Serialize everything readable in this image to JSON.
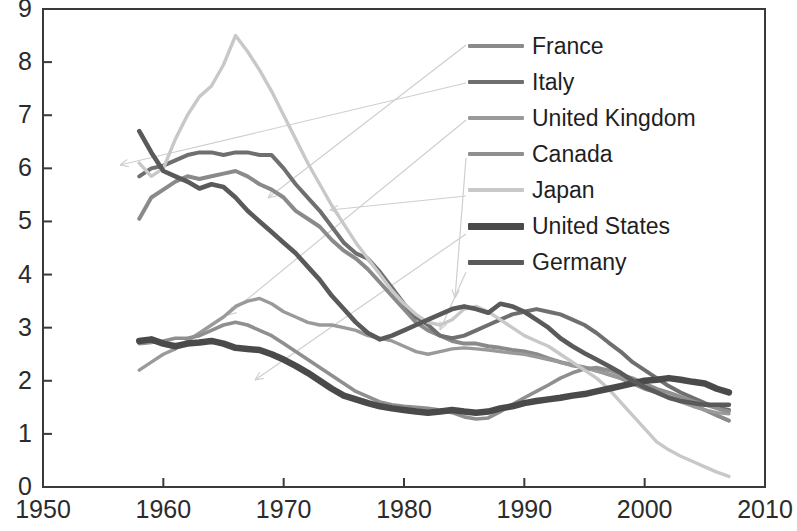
{
  "chart_data": {
    "type": "line",
    "title": "",
    "subtitle": "",
    "xlabel": "",
    "ylabel": "",
    "xlim": [
      1950,
      2010
    ],
    "ylim": [
      0,
      9
    ],
    "xticks": [
      1950,
      1960,
      1970,
      1980,
      1990,
      2000,
      2010
    ],
    "yticks": [
      0,
      1,
      2,
      3,
      4,
      5,
      6,
      7,
      8,
      9
    ],
    "grid": false,
    "legend_position": "top-right",
    "legend": [
      "France",
      "Italy",
      "United Kingdom",
      "Canada",
      "Japan",
      "United States",
      "Germany"
    ],
    "series": [
      {
        "name": "France",
        "color": "#8a8a8a",
        "width": 4.0,
        "x": [
          1958,
          1959,
          1960,
          1961,
          1962,
          1963,
          1964,
          1965,
          1966,
          1967,
          1968,
          1969,
          1970,
          1971,
          1972,
          1973,
          1974,
          1975,
          1976,
          1977,
          1978,
          1979,
          1980,
          1981,
          1982,
          1983,
          1984,
          1985,
          1986,
          1987,
          1988,
          1989,
          1990,
          1991,
          1992,
          1993,
          1994,
          1995,
          1996,
          1997,
          1998,
          1999,
          2000,
          2001,
          2002,
          2003,
          2004,
          2005,
          2006,
          2007
        ],
        "values": [
          5.05,
          5.45,
          5.6,
          5.75,
          5.85,
          5.8,
          5.85,
          5.9,
          5.95,
          5.85,
          5.7,
          5.6,
          5.45,
          5.2,
          5.05,
          4.9,
          4.65,
          4.45,
          4.3,
          4.1,
          3.85,
          3.6,
          3.35,
          3.1,
          2.95,
          2.85,
          2.75,
          2.7,
          2.7,
          2.65,
          2.62,
          2.58,
          2.55,
          2.5,
          2.42,
          2.35,
          2.3,
          2.25,
          2.2,
          2.12,
          2.05,
          1.95,
          1.85,
          1.78,
          1.7,
          1.62,
          1.55,
          1.45,
          1.35,
          1.25
        ]
      },
      {
        "name": "Italy",
        "color": "#6f6f6f",
        "width": 4.0,
        "x": [
          1958,
          1959,
          1960,
          1961,
          1962,
          1963,
          1964,
          1965,
          1966,
          1967,
          1968,
          1969,
          1970,
          1971,
          1972,
          1973,
          1974,
          1975,
          1976,
          1977,
          1978,
          1979,
          1980,
          1981,
          1982,
          1983,
          1984,
          1985,
          1986,
          1987,
          1988,
          1989,
          1990,
          1991,
          1992,
          1993,
          1994,
          1995,
          1996,
          1997,
          1998,
          1999,
          2000,
          2001,
          2002,
          2003,
          2004,
          2005,
          2006,
          2007
        ],
        "values": [
          5.85,
          6.0,
          6.05,
          6.15,
          6.25,
          6.3,
          6.3,
          6.25,
          6.3,
          6.3,
          6.25,
          6.25,
          6.0,
          5.7,
          5.45,
          5.2,
          4.9,
          4.6,
          4.4,
          4.3,
          4.05,
          3.75,
          3.45,
          3.2,
          3.05,
          2.85,
          2.8,
          2.85,
          2.95,
          3.05,
          3.15,
          3.25,
          3.3,
          3.35,
          3.3,
          3.25,
          3.15,
          3.05,
          2.9,
          2.72,
          2.55,
          2.35,
          2.2,
          2.05,
          1.9,
          1.78,
          1.68,
          1.58,
          1.5,
          1.45
        ]
      },
      {
        "name": "United Kingdom",
        "color": "#9a9a9a",
        "width": 3.4,
        "x": [
          1958,
          1959,
          1960,
          1961,
          1962,
          1963,
          1964,
          1965,
          1966,
          1967,
          1968,
          1969,
          1970,
          1971,
          1972,
          1973,
          1974,
          1975,
          1976,
          1977,
          1978,
          1979,
          1980,
          1981,
          1982,
          1983,
          1984,
          1985,
          1986,
          1987,
          1988,
          1989,
          1990,
          1991,
          1992,
          1993,
          1994,
          1995,
          1996,
          1997,
          1998,
          1999,
          2000,
          2001,
          2002,
          2003,
          2004,
          2005,
          2006,
          2007
        ],
        "values": [
          2.2,
          2.35,
          2.5,
          2.6,
          2.75,
          2.9,
          3.05,
          3.2,
          3.4,
          3.5,
          3.55,
          3.45,
          3.3,
          3.2,
          3.1,
          3.05,
          3.05,
          3.0,
          2.95,
          2.85,
          2.8,
          2.75,
          2.65,
          2.55,
          2.5,
          2.55,
          2.6,
          2.62,
          2.6,
          2.58,
          2.55,
          2.52,
          2.5,
          2.45,
          2.4,
          2.35,
          2.28,
          2.25,
          2.18,
          2.12,
          2.05,
          1.98,
          1.88,
          1.8,
          1.7,
          1.6,
          1.52,
          1.45,
          1.4,
          1.38
        ]
      },
      {
        "name": "Canada",
        "color": "#8f8f8f",
        "width": 3.6,
        "x": [
          1958,
          1959,
          1960,
          1961,
          1962,
          1963,
          1964,
          1965,
          1966,
          1967,
          1968,
          1969,
          1970,
          1971,
          1972,
          1973,
          1974,
          1975,
          1976,
          1977,
          1978,
          1979,
          1980,
          1981,
          1982,
          1983,
          1984,
          1985,
          1986,
          1987,
          1988,
          1989,
          1990,
          1991,
          1992,
          1993,
          1994,
          1995,
          1996,
          1997,
          1998,
          1999,
          2000,
          2001,
          2002,
          2003,
          2004,
          2005,
          2006,
          2007
        ],
        "values": [
          2.7,
          2.72,
          2.75,
          2.8,
          2.8,
          2.85,
          2.95,
          3.05,
          3.1,
          3.05,
          2.95,
          2.85,
          2.7,
          2.55,
          2.4,
          2.25,
          2.1,
          1.95,
          1.8,
          1.7,
          1.6,
          1.55,
          1.52,
          1.5,
          1.48,
          1.45,
          1.4,
          1.32,
          1.28,
          1.3,
          1.42,
          1.55,
          1.68,
          1.8,
          1.92,
          2.05,
          2.15,
          2.22,
          2.25,
          2.2,
          2.12,
          2.05,
          1.95,
          1.85,
          1.78,
          1.7,
          1.62,
          1.55,
          1.48,
          1.42
        ]
      },
      {
        "name": "Japan",
        "color": "#c8c8c8",
        "width": 3.4,
        "x": [
          1958,
          1959,
          1960,
          1961,
          1962,
          1963,
          1964,
          1965,
          1966,
          1967,
          1968,
          1969,
          1970,
          1971,
          1972,
          1973,
          1974,
          1975,
          1976,
          1977,
          1978,
          1979,
          1980,
          1981,
          1982,
          1983,
          1984,
          1985,
          1986,
          1987,
          1988,
          1989,
          1990,
          1991,
          1992,
          1993,
          1994,
          1995,
          1996,
          1997,
          1998,
          1999,
          2000,
          2001,
          2002,
          2003,
          2004,
          2005,
          2006,
          2007
        ],
        "values": [
          6.1,
          5.85,
          6.0,
          6.55,
          7.0,
          7.35,
          7.55,
          7.95,
          8.5,
          8.2,
          7.85,
          7.45,
          7.0,
          6.55,
          6.1,
          5.7,
          5.3,
          4.95,
          4.6,
          4.3,
          4.0,
          3.7,
          3.45,
          3.25,
          3.1,
          3.05,
          3.15,
          3.35,
          3.4,
          3.3,
          3.15,
          3.0,
          2.85,
          2.75,
          2.65,
          2.5,
          2.35,
          2.2,
          2.05,
          1.85,
          1.6,
          1.35,
          1.1,
          0.85,
          0.7,
          0.58,
          0.48,
          0.38,
          0.28,
          0.2
        ]
      },
      {
        "name": "United States",
        "color": "#4a4a4a",
        "width": 6.5,
        "x": [
          1958,
          1959,
          1960,
          1961,
          1962,
          1963,
          1964,
          1965,
          1966,
          1967,
          1968,
          1969,
          1970,
          1971,
          1972,
          1973,
          1974,
          1975,
          1976,
          1977,
          1978,
          1979,
          1980,
          1981,
          1982,
          1983,
          1984,
          1985,
          1986,
          1987,
          1988,
          1989,
          1990,
          1991,
          1992,
          1993,
          1994,
          1995,
          1996,
          1997,
          1998,
          1999,
          2000,
          2001,
          2002,
          2003,
          2004,
          2005,
          2006,
          2007
        ],
        "values": [
          2.75,
          2.78,
          2.7,
          2.65,
          2.7,
          2.72,
          2.75,
          2.7,
          2.62,
          2.6,
          2.58,
          2.5,
          2.4,
          2.28,
          2.15,
          2.0,
          1.85,
          1.72,
          1.65,
          1.58,
          1.52,
          1.48,
          1.45,
          1.42,
          1.4,
          1.42,
          1.45,
          1.42,
          1.4,
          1.42,
          1.48,
          1.52,
          1.58,
          1.62,
          1.65,
          1.68,
          1.72,
          1.75,
          1.8,
          1.85,
          1.9,
          1.95,
          2.0,
          2.02,
          2.05,
          2.02,
          1.98,
          1.95,
          1.85,
          1.78
        ]
      },
      {
        "name": "Germany",
        "color": "#5a5a5a",
        "width": 4.6,
        "x": [
          1958,
          1959,
          1960,
          1961,
          1962,
          1963,
          1964,
          1965,
          1966,
          1967,
          1968,
          1969,
          1970,
          1971,
          1972,
          1973,
          1974,
          1975,
          1976,
          1977,
          1978,
          1979,
          1980,
          1981,
          1982,
          1983,
          1984,
          1985,
          1986,
          1987,
          1988,
          1989,
          1990,
          1991,
          1992,
          1993,
          1994,
          1995,
          1996,
          1997,
          1998,
          1999,
          2000,
          2001,
          2002,
          2003,
          2004,
          2005,
          2006,
          2007
        ],
        "values": [
          6.7,
          6.3,
          5.95,
          5.85,
          5.75,
          5.62,
          5.7,
          5.65,
          5.45,
          5.2,
          5.0,
          4.8,
          4.6,
          4.4,
          4.15,
          3.9,
          3.6,
          3.35,
          3.1,
          2.9,
          2.78,
          2.85,
          2.95,
          3.05,
          3.15,
          3.25,
          3.35,
          3.4,
          3.35,
          3.28,
          3.45,
          3.4,
          3.3,
          3.15,
          3.0,
          2.8,
          2.65,
          2.52,
          2.4,
          2.28,
          2.15,
          2.0,
          1.88,
          1.78,
          1.68,
          1.62,
          1.58,
          1.55,
          1.55,
          1.55
        ]
      }
    ]
  },
  "axes": {
    "y_tick_labels": [
      "9",
      "8",
      "7",
      "6",
      "5",
      "4",
      "3",
      "2",
      "1",
      "0"
    ],
    "x_tick_labels": [
      "1950",
      "1960",
      "1970",
      "1980",
      "1990",
      "2000",
      "2010"
    ],
    "frame_color": "#3a3a3a"
  },
  "legend": {
    "items": [
      {
        "label": "France",
        "color": "#8a8a8a",
        "thickness": 4
      },
      {
        "label": "Italy",
        "color": "#6f6f6f",
        "thickness": 4
      },
      {
        "label": "United Kingdom",
        "color": "#9a9a9a",
        "thickness": 4
      },
      {
        "label": "Canada",
        "color": "#8f8f8f",
        "thickness": 4
      },
      {
        "label": "Japan",
        "color": "#c8c8c8",
        "thickness": 4
      },
      {
        "label": "United States",
        "color": "#4a4a4a",
        "thickness": 7
      },
      {
        "label": "Germany",
        "color": "#5a5a5a",
        "thickness": 5
      }
    ]
  },
  "leaders": [
    {
      "name": "france-leader",
      "from": [
        466,
        45
      ],
      "to": [
        268,
        198
      ]
    },
    {
      "name": "italy-leader",
      "from": [
        466,
        83
      ],
      "to": [
        120,
        165
      ]
    },
    {
      "name": "united-kingdom-leader",
      "from": [
        466,
        120
      ],
      "to": [
        228,
        315
      ]
    },
    {
      "name": "canada-leader",
      "from": [
        466,
        158
      ],
      "to": [
        455,
        298
      ]
    },
    {
      "name": "japan-leader",
      "from": [
        466,
        196
      ],
      "to": [
        330,
        210
      ]
    },
    {
      "name": "united-states-leader",
      "from": [
        466,
        234
      ],
      "to": [
        255,
        380
      ]
    },
    {
      "name": "germany-leader",
      "from": [
        466,
        272
      ],
      "to": [
        440,
        330
      ]
    }
  ]
}
